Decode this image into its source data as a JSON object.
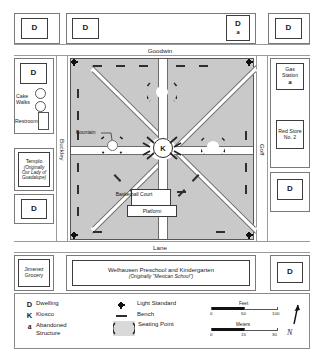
{
  "map": {
    "streets": {
      "top": "Goodwin",
      "left": "Buckley",
      "right": "Goff",
      "bottom": "Lane"
    },
    "top_buildings": [
      {
        "symbol": "D",
        "abandoned": ""
      },
      {
        "symbol": "D",
        "abandoned": ""
      },
      {
        "symbol": "D",
        "abandoned": "a"
      },
      {
        "symbol": "D",
        "abandoned": ""
      }
    ],
    "left_buildings": [
      {
        "symbol": "D",
        "name": "",
        "sub": ""
      },
      {
        "symbol": "",
        "name": "Cake Walks",
        "sub": ""
      },
      {
        "symbol": "",
        "name": "Restrooms",
        "sub": ""
      },
      {
        "symbol": "",
        "name": "Templo",
        "sub": "(Originally Our Lady of Guadalupe)"
      },
      {
        "symbol": "D",
        "name": "",
        "sub": ""
      },
      {
        "symbol": "",
        "name": "Jimenez Grocery",
        "sub": ""
      }
    ],
    "right_buildings": [
      {
        "symbol": "D",
        "name": "",
        "abandoned": ""
      },
      {
        "symbol": "",
        "name": "Gas Station",
        "abandoned": "a"
      },
      {
        "symbol": "",
        "name": "Red Store No. 2",
        "abandoned": ""
      },
      {
        "symbol": "D",
        "name": "",
        "abandoned": ""
      },
      {
        "symbol": "D",
        "name": "",
        "abandoned": ""
      }
    ],
    "plaza": {
      "kiosco_symbol": "K",
      "fountain_label": "Fountain",
      "basketball_label": "Basketball Court",
      "platform_label": "Platform"
    },
    "school": {
      "name": "Welhausen Preschool and Kindergarten",
      "original": "(Originally \"Mexican School\")"
    }
  },
  "legend": {
    "items": [
      {
        "symbol": "D",
        "label": "Dwelling"
      },
      {
        "symbol": "K",
        "label": "Kiosco"
      },
      {
        "symbol": "a",
        "label": "Abandoned Structure"
      }
    ],
    "symbol_items": [
      {
        "icon": "light-standard-icon",
        "label": "Light Standard"
      },
      {
        "icon": "bench-icon",
        "label": "Bench"
      },
      {
        "icon": "seating-point-icon",
        "label": "Seating Point"
      }
    ],
    "scales": [
      {
        "name": "Feet",
        "ticks": [
          "0",
          "50",
          "100"
        ]
      },
      {
        "name": "Meters",
        "ticks": [
          "0",
          "15",
          "30"
        ]
      }
    ],
    "north_label": "N"
  }
}
